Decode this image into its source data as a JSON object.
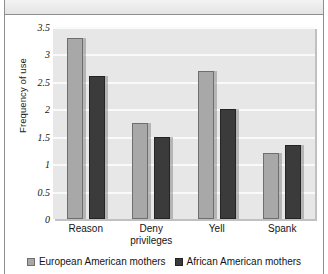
{
  "chart_data": {
    "type": "bar",
    "title": "",
    "subtitle": "",
    "xlabel": "",
    "ylabel": "Frequency of use",
    "ylim": [
      0,
      3.5
    ],
    "ytick_labels": [
      "3.5",
      "3",
      "2.5",
      "2",
      "1.5",
      "1",
      "0.5",
      "0"
    ],
    "ytick_values": [
      3.5,
      3,
      2.5,
      2,
      1.5,
      1,
      0.5,
      0
    ],
    "grid": true,
    "legend_position": "bottom",
    "categories": [
      "Reason",
      "Deny privileges",
      "Yell",
      "Spank"
    ],
    "category_lines": [
      [
        "Reason"
      ],
      [
        "Deny",
        "privileges"
      ],
      [
        "Yell"
      ],
      [
        "Spank"
      ]
    ],
    "series": [
      {
        "name": "European American mothers",
        "color": "#a8a8a8",
        "values": [
          3.3,
          1.75,
          2.7,
          1.2
        ]
      },
      {
        "name": "African American mothers",
        "color": "#3b3b3b",
        "values": [
          2.6,
          1.5,
          2.0,
          1.35
        ]
      }
    ]
  },
  "legend": {
    "entries": [
      {
        "label": "European American mothers"
      },
      {
        "label": "African American mothers"
      }
    ]
  }
}
